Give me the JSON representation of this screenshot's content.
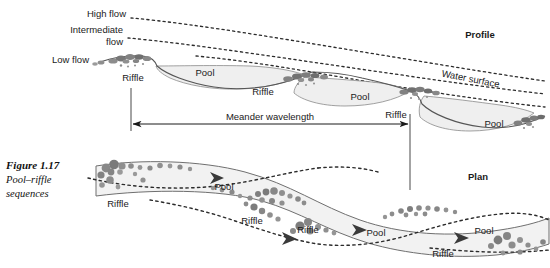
{
  "figure": {
    "caption_title": "Figure 1.17",
    "caption_line2": "Pool–riffle",
    "caption_line3": "sequences"
  },
  "panels": {
    "profile_label": "Profile",
    "plan_label": "Plan"
  },
  "profile": {
    "flow_labels": {
      "high": "High flow",
      "intermediate_line1": "Intermediate",
      "intermediate_line2": "flow",
      "low": "Low flow"
    },
    "water_surface_label": "Water surface",
    "features": [
      {
        "type": "riffle",
        "label": "Riffle"
      },
      {
        "type": "pool",
        "label": "Pool"
      },
      {
        "type": "riffle",
        "label": "Riffle"
      },
      {
        "type": "pool",
        "label": "Pool"
      },
      {
        "type": "riffle",
        "label": "Riffle"
      },
      {
        "type": "pool",
        "label": "Pool"
      }
    ],
    "feature_labels": {
      "riffle_1": "Riffle",
      "pool_1": "Pool",
      "riffle_2": "Riffle",
      "pool_2": "Pool",
      "riffle_3": "Riffle",
      "pool_3": "Pool"
    }
  },
  "annotation": {
    "meander_wavelength_label": "Meander wavelength"
  },
  "plan": {
    "feature_labels": {
      "riffle_1": "Riffle",
      "pool_1": "Pool",
      "riffle_2": "Riffle",
      "pool_2": "Pool",
      "riffle_3": "Riffle",
      "pool_3": "Pool",
      "riffle_4": "Riffle"
    }
  },
  "colors": {
    "channel_fill": "#f2f2f2",
    "channel_stroke": "#6b6b6b",
    "gravel_dark": "#7a7a7a",
    "gravel_mid": "#9a9a9a",
    "text": "#1a1a1a",
    "background": "#ffffff"
  }
}
